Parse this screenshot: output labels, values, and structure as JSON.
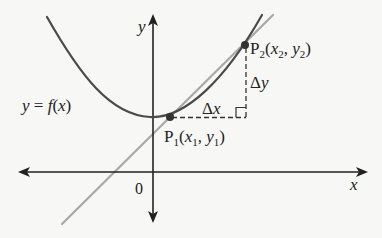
{
  "figure": {
    "colors": {
      "background": "#f7f7f5",
      "axes": "#222222",
      "curve": "#4a4a4a",
      "secant": "#a8a8a8",
      "points": "#333333",
      "dashed": "#333333",
      "text": "#222222"
    },
    "axes": {
      "x_label": "x",
      "y_label": "y",
      "origin_label": "0"
    },
    "curve": {
      "label": "y = f(x)",
      "label_parts": {
        "lhs": "y",
        "eq": " = ",
        "rhs_f": "f",
        "rhs_open": "(",
        "rhs_x": "x",
        "rhs_close": ")"
      }
    },
    "points": [
      {
        "id": "P1",
        "name": "P",
        "subscript": "1",
        "coord_x": "x",
        "coord_x_sub": "1",
        "coord_y": "y",
        "coord_y_sub": "1"
      },
      {
        "id": "P2",
        "name": "P",
        "subscript": "2",
        "coord_x": "x",
        "coord_x_sub": "2",
        "coord_y": "y",
        "coord_y_sub": "2"
      }
    ],
    "increments": {
      "delta_x": {
        "symbol": "Δ",
        "var": "x"
      },
      "delta_y": {
        "symbol": "Δ",
        "var": "y"
      }
    },
    "punct": {
      "open": "(",
      "comma": ", ",
      "close": ")"
    }
  }
}
